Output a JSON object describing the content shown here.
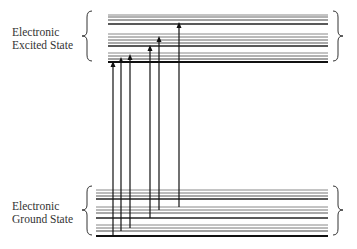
{
  "labels": {
    "excited_line1": "Electronic",
    "excited_line2": "Excited State",
    "ground_line1": "Electronic",
    "ground_line2": "Ground State"
  },
  "colors": {
    "line": "#222222",
    "text": "#333333"
  },
  "excited_band": {
    "x1": 108,
    "x2": 328,
    "levels": [
      {
        "y": 15,
        "w": 1.0,
        "c": "#888"
      },
      {
        "y": 17,
        "w": 1.0,
        "c": "#666"
      },
      {
        "y": 20,
        "w": 1.2,
        "c": "#444"
      },
      {
        "y": 24,
        "w": 1.6,
        "c": "#222"
      },
      {
        "y": 34,
        "w": 1.0,
        "c": "#888"
      },
      {
        "y": 37,
        "w": 1.0,
        "c": "#777"
      },
      {
        "y": 40,
        "w": 1.0,
        "c": "#666"
      },
      {
        "y": 43,
        "w": 1.2,
        "c": "#555"
      },
      {
        "y": 46,
        "w": 1.6,
        "c": "#222"
      },
      {
        "y": 53,
        "w": 1.0,
        "c": "#888"
      },
      {
        "y": 56,
        "w": 1.0,
        "c": "#666"
      },
      {
        "y": 59,
        "w": 1.2,
        "c": "#444"
      },
      {
        "y": 62,
        "w": 1.8,
        "c": "#111"
      }
    ]
  },
  "ground_band": {
    "x1": 96,
    "x2": 328,
    "levels": [
      {
        "y": 190,
        "w": 1.0,
        "c": "#888"
      },
      {
        "y": 193,
        "w": 1.0,
        "c": "#777"
      },
      {
        "y": 196,
        "w": 1.2,
        "c": "#555"
      },
      {
        "y": 199,
        "w": 1.6,
        "c": "#222"
      },
      {
        "y": 207,
        "w": 1.0,
        "c": "#888"
      },
      {
        "y": 210,
        "w": 1.0,
        "c": "#777"
      },
      {
        "y": 213,
        "w": 1.2,
        "c": "#555"
      },
      {
        "y": 218,
        "w": 1.6,
        "c": "#222"
      },
      {
        "y": 225,
        "w": 1.0,
        "c": "#888"
      },
      {
        "y": 228,
        "w": 1.0,
        "c": "#777"
      },
      {
        "y": 231,
        "w": 1.2,
        "c": "#444"
      },
      {
        "y": 236,
        "w": 1.8,
        "c": "#111"
      }
    ]
  },
  "transitions": [
    {
      "x": 113,
      "y_from": 236,
      "y_to": 62
    },
    {
      "x": 121,
      "y_from": 231,
      "y_to": 58
    },
    {
      "x": 130,
      "y_from": 228,
      "y_to": 55
    },
    {
      "x": 150,
      "y_from": 218,
      "y_to": 46
    },
    {
      "x": 159,
      "y_from": 210,
      "y_to": 37
    },
    {
      "x": 179,
      "y_from": 207,
      "y_to": 23
    }
  ]
}
